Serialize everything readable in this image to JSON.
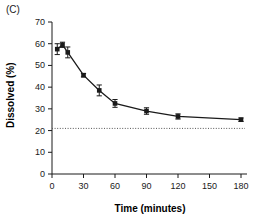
{
  "figure": {
    "panel_label": "(C)"
  },
  "chart_data": {
    "type": "line",
    "title": "",
    "xlabel": "Time (minutes)",
    "ylabel": "Dissolved (%)",
    "xlim": [
      0,
      180
    ],
    "ylim": [
      0,
      70
    ],
    "xticks": [
      0,
      30,
      60,
      90,
      120,
      150,
      180
    ],
    "yticks": [
      0,
      10,
      20,
      30,
      40,
      50,
      60,
      70
    ],
    "xtick_labels": [
      "0",
      "30",
      "60",
      "90",
      "120",
      "150",
      "180"
    ],
    "ytick_labels": [
      "0",
      "10",
      "20",
      "30",
      "40",
      "50",
      "60",
      "70"
    ],
    "grid": false,
    "legend": null,
    "marker": "filled-square",
    "line_color": "#1a1a1a",
    "marker_color": "#1a1a1a",
    "errorbar_color": "#1a1a1a",
    "reference_line": {
      "value": 21,
      "style": "dotted",
      "color": "#555555",
      "label": ""
    },
    "series": [
      {
        "name": "Dissolved",
        "x": [
          5,
          10,
          15,
          30,
          45,
          60,
          90,
          120,
          180
        ],
        "values": [
          57.5,
          59.5,
          56.0,
          45.5,
          38.5,
          32.5,
          29.0,
          26.5,
          25.0
        ],
        "yerr": [
          2.5,
          1.2,
          2.5,
          0.8,
          2.5,
          1.8,
          1.5,
          1.2,
          0.8
        ]
      }
    ]
  }
}
